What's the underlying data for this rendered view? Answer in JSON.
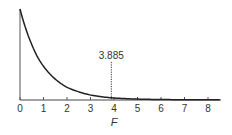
{
  "chart_data": {
    "type": "line",
    "title": "",
    "xlabel": "F",
    "ylabel": "",
    "xlim": [
      0,
      8.5
    ],
    "x_ticks": [
      0,
      1,
      2,
      3,
      4,
      5,
      6,
      7,
      8
    ],
    "x_tick_labels": [
      "0",
      "1",
      "2",
      "3",
      "4",
      "5",
      "6",
      "7",
      "8"
    ],
    "grid": false,
    "legend": null,
    "series": [
      {
        "name": "F-distribution density",
        "x": [
          0,
          0.25,
          0.5,
          0.75,
          1,
          1.5,
          2,
          2.5,
          3,
          3.5,
          4,
          5,
          6,
          7,
          8,
          8.5
        ],
        "y": [
          1.0,
          0.78,
          0.61,
          0.47,
          0.37,
          0.23,
          0.14,
          0.09,
          0.055,
          0.035,
          0.022,
          0.01,
          0.005,
          0.003,
          0.002,
          0.0015
        ]
      }
    ],
    "annotations": [
      {
        "type": "vline",
        "x": 3.885,
        "style": "dotted",
        "label": "3.885"
      }
    ]
  },
  "labels": {
    "critical_value": "3.885",
    "x_axis": "F"
  }
}
